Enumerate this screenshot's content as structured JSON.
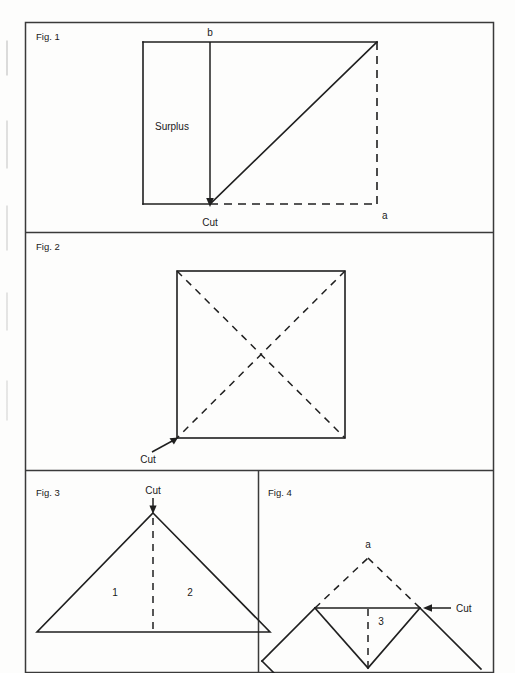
{
  "document": {
    "kind": "instructional-figure-plate",
    "panels": [
      {
        "id": "fig1",
        "label": "Fig. 1",
        "annotations": {
          "point_b": "b",
          "point_a": "a",
          "surplus": "Surplus",
          "cut": "Cut"
        }
      },
      {
        "id": "fig2",
        "label": "Fig. 2",
        "annotations": {
          "cut": "Cut"
        }
      },
      {
        "id": "fig3",
        "label": "Fig. 3",
        "annotations": {
          "cut": "Cut",
          "region_1": "1",
          "region_2": "2"
        }
      },
      {
        "id": "fig4",
        "label": "Fig. 4",
        "annotations": {
          "point_a": "a",
          "cut": "Cut",
          "region_3": "3"
        }
      }
    ]
  },
  "colors": {
    "ink": "#1f1f1f",
    "border": "#3a3a3a",
    "paper": "#fdfdfc"
  },
  "geometry": {
    "plate": {
      "x": 25,
      "y": 22,
      "w": 469,
      "h": 651
    },
    "dividers": [
      232,
      470
    ],
    "fig1": {
      "rect_left": 143,
      "rect_top": 42,
      "rect_right": 377,
      "rect_bottom": 204,
      "cut_x": 210,
      "label_pos": {
        "x": 36,
        "y": 40
      },
      "b_pos": {
        "x": 210,
        "y": 36
      },
      "a_pos": {
        "x": 382,
        "y": 218
      },
      "surplus_pos": {
        "x": 155,
        "y": 130
      },
      "cut_pos": {
        "x": 210,
        "y": 226
      }
    },
    "fig2": {
      "sq_left": 177,
      "sq_top": 271,
      "sq_right": 345,
      "sq_bottom": 438,
      "label_pos": {
        "x": 36,
        "y": 250
      },
      "cut_pos": {
        "x": 148,
        "y": 460
      },
      "arrow_tail": {
        "x": 152,
        "y": 452
      }
    },
    "fig3": {
      "apex": {
        "x": 153,
        "y": 513
      },
      "base_left": {
        "x": 37,
        "y": 632
      },
      "base_right": {
        "x": 270,
        "y": 632
      },
      "label_pos": {
        "x": 36,
        "y": 494
      },
      "cut_pos": {
        "x": 153,
        "y": 493
      },
      "one_pos": {
        "x": 115,
        "y": 592
      },
      "two_pos": {
        "x": 189,
        "y": 592
      }
    },
    "fig4": {
      "apex_a": {
        "x": 368,
        "y": 558
      },
      "left_node": {
        "x": 315,
        "y": 608
      },
      "right_node": {
        "x": 420,
        "y": 608
      },
      "lower_apex": {
        "x": 368,
        "y": 668
      },
      "label_pos": {
        "x": 268,
        "y": 494
      },
      "a_pos": {
        "x": 368,
        "y": 546
      },
      "cut_pos": {
        "x": 458,
        "y": 611
      },
      "three_pos": {
        "x": 381,
        "y": 621
      }
    }
  }
}
